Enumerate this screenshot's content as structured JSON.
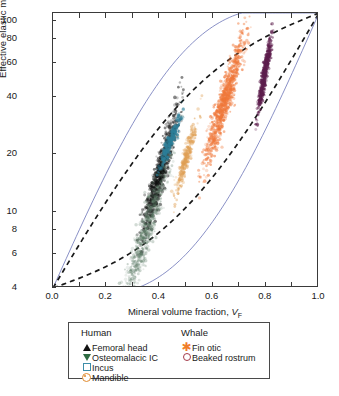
{
  "chart_data": {
    "type": "scatter",
    "title": "",
    "xlabel": "Mineral volume fraction, V_F",
    "ylabel": "Effective elastic modulus, E (GPa)",
    "xlim": [
      0.0,
      1.0
    ],
    "ylim": [
      4,
      110
    ],
    "yscale": "log",
    "xscale": "linear",
    "grid": false,
    "xticks": [
      "0.0",
      "0.2",
      "0.4",
      "0.6",
      "0.8",
      "1.0"
    ],
    "xtick_values": [
      0.0,
      0.2,
      0.4,
      0.6,
      0.8,
      1.0
    ],
    "yticks": [
      "4",
      "6",
      "8",
      "10",
      "20",
      "40",
      "60",
      "80",
      "100"
    ],
    "ytick_values": [
      4,
      6,
      8,
      10,
      20,
      40,
      60,
      80,
      100
    ],
    "legend_position": "below-axes",
    "legend_groups": [
      {
        "title": "Human",
        "entries": [
          {
            "label": "Femoral head",
            "marker": "triangle-up",
            "color": "#111111"
          },
          {
            "label": "Osteomalacic IC",
            "marker": "triangle-down",
            "color": "#2e6b42"
          },
          {
            "label": "Incus",
            "marker": "open-square",
            "color": "#3d8ea8"
          },
          {
            "label": "Mandible",
            "marker": "open-diamond",
            "color": "#e08a2e"
          }
        ]
      },
      {
        "title": "Whale",
        "entries": [
          {
            "label": "Fin otic",
            "marker": "asterisk",
            "color": "#f07c28"
          },
          {
            "label": "Beaked rostrum",
            "marker": "open-circle",
            "color": "#a33a4a"
          }
        ]
      }
    ],
    "series": [
      {
        "name": "Femoral head",
        "color": "#111111",
        "n_points": 900,
        "x_center": 0.4,
        "y_center": 15.5,
        "x_spread": 0.055,
        "y_spread": 0.16,
        "opacity": 0.55
      },
      {
        "name": "Osteomalacic IC",
        "color": "#5d7d68",
        "n_points": 700,
        "x_center": 0.35,
        "y_center": 8.0,
        "x_spread": 0.075,
        "y_spread": 0.2,
        "opacity": 0.35
      },
      {
        "name": "Incus",
        "color": "#2d7f99",
        "n_points": 300,
        "x_center": 0.44,
        "y_center": 23.0,
        "x_spread": 0.033,
        "y_spread": 0.07,
        "opacity": 0.65
      },
      {
        "name": "Mandible",
        "color": "#e0a055",
        "n_points": 300,
        "x_center": 0.5,
        "y_center": 19.0,
        "x_spread": 0.035,
        "y_spread": 0.1,
        "opacity": 0.55
      },
      {
        "name": "Fin otic",
        "color": "#f0783a",
        "n_points": 900,
        "x_center": 0.645,
        "y_center": 38.0,
        "x_spread": 0.062,
        "y_spread": 0.17,
        "opacity": 0.6
      },
      {
        "name": "Beaked rostrum",
        "color": "#5e1f4e",
        "n_points": 500,
        "x_center": 0.795,
        "y_center": 52.0,
        "x_spread": 0.022,
        "y_spread": 0.1,
        "opacity": 0.7
      }
    ],
    "bound_curves": [
      {
        "name": "voigt-upper-bound",
        "style": "solid",
        "color": "#6b73b8",
        "endpoints": [
          [
            0.0,
            4.0
          ],
          [
            1.0,
            110.0
          ]
        ],
        "bulge": 0.8
      },
      {
        "name": "hs-upper-bound",
        "style": "dashed",
        "color": "#1a1a1a",
        "endpoints": [
          [
            0.0,
            4.0
          ],
          [
            1.0,
            110.0
          ]
        ],
        "bulge": 0.42
      },
      {
        "name": "hs-lower-bound",
        "style": "dashed",
        "color": "#1a1a1a",
        "endpoints": [
          [
            0.0,
            4.0
          ],
          [
            1.0,
            110.0
          ]
        ],
        "bulge": -0.45
      },
      {
        "name": "reuss-lower-bound",
        "style": "solid",
        "color": "#6b73b8",
        "endpoints": [
          [
            0.0,
            4.0
          ],
          [
            1.0,
            110.0
          ]
        ],
        "bulge": -0.82
      }
    ]
  }
}
